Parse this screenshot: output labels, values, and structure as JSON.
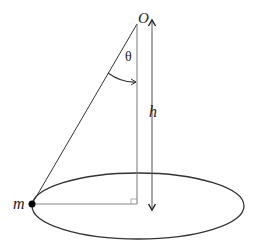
{
  "diagram": {
    "type": "conical-pendulum",
    "labels": {
      "pivot": "O",
      "angle": "θ",
      "height": "h",
      "mass": "m"
    },
    "colors": {
      "string": "#333333",
      "vertical": "#666666",
      "ellipse": "#333333",
      "mass": "#000000",
      "arrow": "#333333"
    },
    "geometry": {
      "pivot": [
        137,
        24
      ],
      "mass": [
        32,
        204
      ],
      "ellipse_center": [
        138,
        206
      ],
      "ellipse_radii": [
        106,
        33
      ],
      "height_arrow_x": 152,
      "height_arrow_y": [
        20,
        210
      ]
    }
  }
}
